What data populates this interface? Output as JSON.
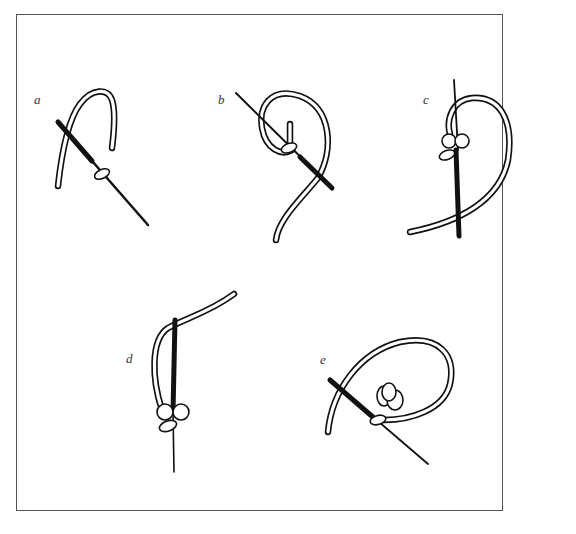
{
  "figure": {
    "type": "illustration",
    "steps": [
      {
        "label": "a"
      },
      {
        "label": "b"
      },
      {
        "label": "c"
      },
      {
        "label": "d"
      },
      {
        "label": "e"
      }
    ],
    "colors": {
      "ink": "#111111",
      "frame": "#555555",
      "background": "#ffffff"
    }
  }
}
